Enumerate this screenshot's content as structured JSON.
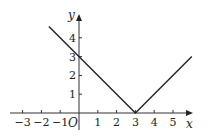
{
  "chart_data": {
    "type": "line",
    "title": "",
    "xlabel": "x",
    "ylabel": "y",
    "origin_label": "O",
    "xlim": [
      -3.5,
      6.2
    ],
    "ylim": [
      -0.6,
      5.1
    ],
    "grid": false,
    "x_ticks": [
      -3,
      -2,
      -1,
      1,
      2,
      3,
      4,
      5
    ],
    "x_tick_labels": [
      "−3",
      "−2",
      "−1",
      "1",
      "2",
      "3",
      "4",
      "5"
    ],
    "y_ticks": [
      1,
      2,
      3,
      4
    ],
    "y_tick_labels": [
      "1",
      "2",
      "3",
      "4"
    ],
    "series": [
      {
        "name": "y = |x − 3|",
        "x": [
          -1.6,
          3,
          6
        ],
        "y": [
          4.6,
          0,
          3
        ]
      }
    ],
    "line_color": "#222222"
  }
}
